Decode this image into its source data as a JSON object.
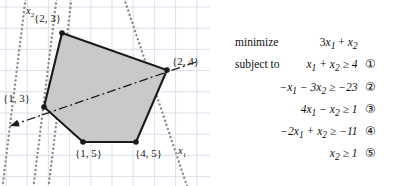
{
  "figure": {
    "axis_x_label": "x",
    "axis_x_sub": "1",
    "axis_y_label": "x",
    "axis_y_sub": "2",
    "vertex_labels": [
      {
        "text": "{2, 3}",
        "x": 34,
        "y": 13
      },
      {
        "text": "{2, 4}",
        "x": 172,
        "y": 56
      },
      {
        "text": "{1, 3}",
        "x": 3,
        "y": 93
      },
      {
        "text": "{1, 5}",
        "x": 75,
        "y": 148
      },
      {
        "text": "{4, 5}",
        "x": 135,
        "y": 148
      }
    ],
    "polygon_points": "62,33 167,70 136,142 83,142 44,107",
    "fill_color": "#c9c9c9",
    "edge_color": "#1a1a1a",
    "grid_color": "#d6dde8",
    "dotted_color": "#8c8c8c",
    "objective_line_color": "#1a1a1a",
    "grid_spacing": 21.2,
    "grid_origin_x": 6,
    "grid_origin_y": 7,
    "dotted_lines": [
      {
        "x1": 26,
        "y1": -5,
        "x2": 2,
        "y2": 191
      },
      {
        "x1": 57,
        "y1": -5,
        "x2": 33,
        "y2": 191
      },
      {
        "x1": 72,
        "y1": -5,
        "x2": 48,
        "y2": 191
      },
      {
        "x1": 187,
        "y1": 186,
        "x2": 123,
        "y2": -5
      }
    ],
    "objective_line": {
      "x1": 196,
      "y1": 62,
      "x2": 10,
      "y2": 126
    }
  },
  "problem": {
    "objective_keyword": "minimize",
    "constraint_keyword": "subject to",
    "objective": {
      "coef1": "3",
      "var1": "x",
      "sub1": "1",
      "op": "+",
      "coef2": "",
      "var2": "x",
      "sub2": "2"
    },
    "constraints": [
      {
        "expr_html": "x<sub>1</sub> + x<sub>2</sub> ≥ 4",
        "lhs": "x1 + x2",
        "rel": "≥",
        "rhs": "4",
        "tag": "①"
      },
      {
        "expr_html": "−x<sub>1</sub> − 3x<sub>2</sub> ≥ −23",
        "lhs": "-x1 - 3x2",
        "rel": "≥",
        "rhs": "-23",
        "tag": "②"
      },
      {
        "expr_html": "4x<sub>1</sub> − x<sub>2</sub> ≥ 1",
        "lhs": "4x1 - x2",
        "rel": "≥",
        "rhs": "1",
        "tag": "③"
      },
      {
        "expr_html": "−2x<sub>1</sub> + x<sub>2</sub> ≥ −11",
        "lhs": "-2x1 + x2",
        "rel": "≥",
        "rhs": "-11",
        "tag": "④"
      },
      {
        "expr_html": "x<sub>2</sub> ≥ 1",
        "lhs": "x2",
        "rel": "≥",
        "rhs": "1",
        "tag": "⑤"
      }
    ]
  }
}
